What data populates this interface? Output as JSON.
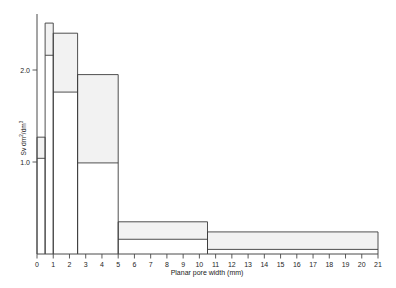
{
  "chart_data": {
    "type": "bar",
    "title": "",
    "subtitle": "",
    "xlabel": "Planar pore width (mm)",
    "ylabel": "Sv dm2/dm3",
    "ylabel_display": "Sv dm²/dm³",
    "xlim": [
      0,
      21
    ],
    "ylim": [
      0,
      2.75
    ],
    "grid": false,
    "legend": null,
    "x_ticks": [
      0,
      1,
      2,
      3,
      4,
      5,
      6,
      7,
      8,
      9,
      10,
      11,
      12,
      13,
      14,
      15,
      16,
      17,
      18,
      19,
      20,
      21
    ],
    "x_tick_labels": [
      "0",
      "1",
      "2",
      "3",
      "4",
      "5",
      "6",
      "7",
      "8",
      "9",
      "10",
      "11",
      "12",
      "13",
      "14",
      "15",
      "16",
      "17",
      "18",
      "19",
      "20",
      "21"
    ],
    "y_ticks": [
      1.0,
      2.0
    ],
    "y_tick_labels": [
      "1.0",
      "2.0"
    ],
    "bar_edge_color": "#3c3c3c",
    "band_fill_color": "#f2f2f2",
    "axis_color": "#4a4a4a",
    "bars": [
      {
        "label": "0-0.5",
        "x_start": 0.0,
        "x_end": 0.5,
        "value": 1.27,
        "band_low": 1.04,
        "band_high": 1.27
      },
      {
        "label": "0.5-1",
        "x_start": 0.5,
        "x_end": 1.0,
        "value": 2.51,
        "band_low": 2.16,
        "band_high": 2.51
      },
      {
        "label": "1-2.5",
        "x_start": 1.0,
        "x_end": 2.5,
        "value": 2.4,
        "band_low": 1.76,
        "band_high": 2.4
      },
      {
        "label": "2.5-5",
        "x_start": 2.5,
        "x_end": 5.0,
        "value": 1.95,
        "band_low": 0.99,
        "band_high": 1.95
      },
      {
        "label": "5-10.5",
        "x_start": 5.0,
        "x_end": 10.5,
        "value": 0.35,
        "band_low": 0.16,
        "band_high": 0.35
      },
      {
        "label": "10.5-21",
        "x_start": 10.5,
        "x_end": 21.0,
        "value": 0.24,
        "band_low": 0.05,
        "band_high": 0.24
      }
    ]
  }
}
